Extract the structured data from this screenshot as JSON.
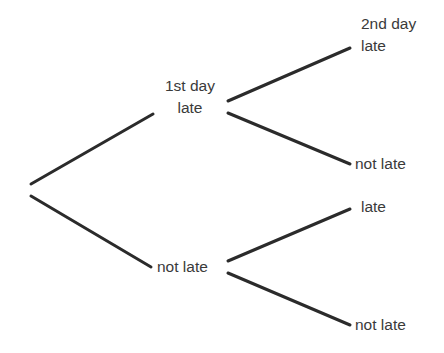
{
  "diagram": {
    "type": "probability-tree",
    "root": {
      "branches": [
        {
          "label_line1": "1st day",
          "label_line2": "late",
          "children": [
            {
              "label_line1": "2nd day",
              "label_line2": "late"
            },
            {
              "label": "not late"
            }
          ]
        },
        {
          "label": "not late",
          "children": [
            {
              "label": "late"
            },
            {
              "label": "not late"
            }
          ]
        }
      ]
    },
    "colors": {
      "line": "#2b2b2b",
      "text": "#3a3a3a",
      "background": "#ffffff"
    }
  }
}
